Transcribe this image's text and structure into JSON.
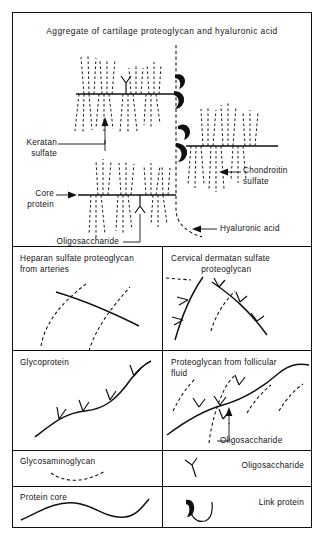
{
  "figure": {
    "aggregate": {
      "title": "Aggregate of cartilage proteoglycan and hyaluronic acid",
      "labels": {
        "keratan_sulfate": "Keratan\nsulfate",
        "core_protein": "Core\nprotein",
        "chondroitin_sulfate": "Chondroitin\nsulfate",
        "hyaluronic_acid": "Hyaluronic acid",
        "oligosaccharide": "Oligosaccharide"
      }
    },
    "panels": [
      {
        "id": "heparan-sulfate-proteoglycan",
        "title": "Heparan sulfate proteoglycan\nfrom arteries",
        "align": "left"
      },
      {
        "id": "cervical-dermatan-sulfate-proteoglycan",
        "title": "Cervical dermatan sulfate\n            proteoglycan",
        "align": "left"
      },
      {
        "id": "glycoprotein",
        "title": "Glycoprotein",
        "align": "left"
      },
      {
        "id": "proteoglycan-from-follicular-fluid",
        "title": "Proteoglycan from follicular\nfluid",
        "align": "left",
        "callout": "Oligosaccharide"
      }
    ],
    "legend": [
      {
        "id": "glycosaminoglycan",
        "label": "Glycosaminoglycan",
        "symbol": "dashed-curve"
      },
      {
        "id": "oligosaccharide",
        "label": "Oligosaccharide",
        "symbol": "y-branch"
      },
      {
        "id": "protein-core",
        "label": "Protein core",
        "symbol": "solid-wavy-line"
      },
      {
        "id": "link-protein",
        "label": "Link protein",
        "symbol": "hook-with-blob"
      }
    ]
  },
  "colors": {
    "ink": "#111111",
    "paper": "#ffffff"
  }
}
